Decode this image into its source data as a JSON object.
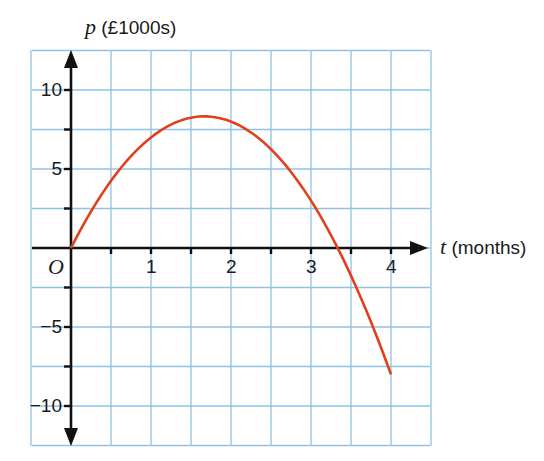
{
  "chart_data": {
    "type": "line",
    "title": "",
    "xlabel": "t (months)",
    "ylabel": "p (£1000s)",
    "xlabel_var": "t",
    "xlabel_unit": "(months)",
    "ylabel_var": "p",
    "ylabel_unit": "(£1000s)",
    "origin_label": "O",
    "xlim": [
      -0.5,
      4.5
    ],
    "ylim": [
      -12.5,
      12.5
    ],
    "x_ticks": [
      1,
      2,
      3,
      4
    ],
    "x_tick_labels": [
      "1",
      "2",
      "3",
      "4"
    ],
    "y_ticks": [
      10,
      5,
      -5,
      -10
    ],
    "y_tick_labels": [
      "10",
      "5",
      "−5",
      "−10"
    ],
    "grid": true,
    "grid_step_x": 0.5,
    "grid_step_y": 2.5,
    "series": [
      {
        "name": "p = 10t − 3t²",
        "color": "#e0401c",
        "x": [
          0,
          0.5,
          1,
          1.5,
          1.667,
          2,
          2.5,
          3,
          3.333,
          3.5,
          4
        ],
        "y": [
          0,
          4.25,
          7,
          8.25,
          8.33,
          8,
          6.25,
          3,
          0,
          -1.75,
          -8
        ]
      }
    ]
  }
}
